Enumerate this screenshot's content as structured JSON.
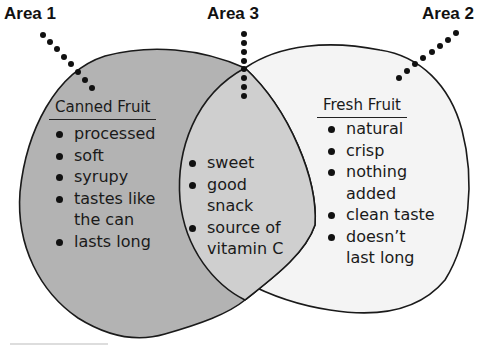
{
  "diagram": {
    "type": "venn",
    "colors": {
      "area1_fill": "#b3b3b3",
      "area2_fill": "#f4f4f4",
      "overlap_fill": "#cfcfcf",
      "outline": "#1a1a1a"
    },
    "labels": {
      "area1": "Area 1",
      "area2": "Area 2",
      "area3": "Area 3"
    },
    "area1": {
      "heading": "Canned Fruit",
      "items": [
        "processed",
        "soft",
        "syrupy",
        "tastes like",
        "the can",
        "lasts long"
      ]
    },
    "area3": {
      "items": [
        "sweet",
        "good",
        "snack",
        "source of",
        "vitamin C"
      ]
    },
    "area2": {
      "heading": "Fresh Fruit",
      "items": [
        "natural",
        "crisp",
        "nothing",
        "added",
        "clean taste",
        "doesn’t",
        "last long"
      ]
    }
  }
}
